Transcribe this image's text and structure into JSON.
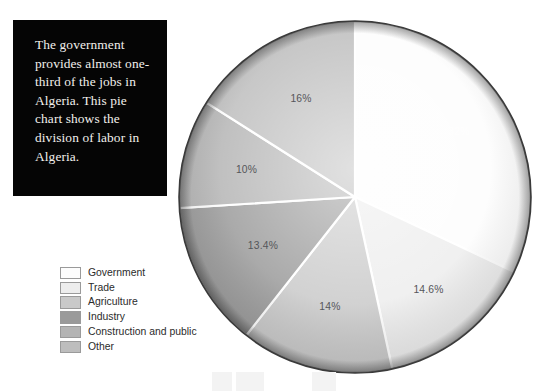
{
  "caption": {
    "text": "The government provides almost one-third of the jobs in Algeria. This pie chart shows the division of labor in Algeria."
  },
  "legend": {
    "items": [
      {
        "label": "Government",
        "color": "#fdfdfd"
      },
      {
        "label": "Trade",
        "color": "#ededed"
      },
      {
        "label": "Agriculture",
        "color": "#c9c9c9"
      },
      {
        "label": "Industry",
        "color": "#9a9a9a"
      },
      {
        "label": "Construction and public",
        "color": "#b4b4b4"
      },
      {
        "label": "Other",
        "color": "#bdbdbd"
      }
    ]
  },
  "chart_data": {
    "type": "pie",
    "title": "",
    "legend_position": "left-bottom",
    "start_angle_deg": 0,
    "direction": "clockwise",
    "categories": [
      "Government",
      "Trade",
      "Agriculture",
      "Industry",
      "Construction and public",
      "Other"
    ],
    "values": [
      32,
      14.6,
      14,
      13.4,
      10,
      16
    ],
    "labels": [
      "32%",
      "14.6%",
      "14%",
      "13.4%",
      "10%",
      "16%"
    ],
    "colors": [
      "#fdfdfd",
      "#ededed",
      "#c9c9c9",
      "#9a9a9a",
      "#b4b4b4",
      "#bdbdbd"
    ],
    "label_colors": [
      "#ffffff",
      "#55565a",
      "#55565a",
      "#55565a",
      "#55565a",
      "#55565a"
    ],
    "units": "percent",
    "total": 100
  }
}
